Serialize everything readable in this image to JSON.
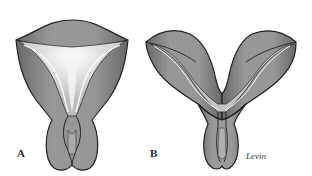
{
  "figure": {
    "panels": [
      {
        "id": "A",
        "label": "A",
        "description": "Uterus with single cavity extending into a septum (septate/subseptate uterus, smooth fundus)"
      },
      {
        "id": "B",
        "label": "B",
        "description": "Bicornuate uterus with indented fundus and two horns"
      }
    ],
    "signature": "Levin",
    "colors": {
      "outer_wall": "#8a8a8a",
      "wall_dark": "#5a5a5a",
      "cavity": "#c8c8c8",
      "cavity_highlight": "#f2f2f2",
      "outline": "#222222",
      "notch_dark": "#2e2e2e"
    }
  }
}
